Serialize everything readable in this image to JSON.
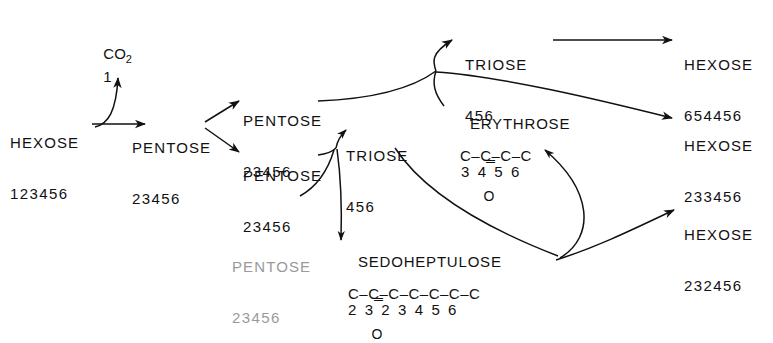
{
  "figure": {
    "background_color": "#ffffff",
    "ink_color": "#111111",
    "faded_ink_color": "#9a9a9a"
  },
  "nodes": {
    "hexose_start": {
      "name": "HEXOSE",
      "digits": "123456"
    },
    "co2": {
      "name": "CO",
      "subscript": "2",
      "digits": "1"
    },
    "pentose_main": {
      "name": "PENTOSE",
      "digits": "23456"
    },
    "pentose_upper": {
      "name": "PENTOSE",
      "digits": "23456"
    },
    "pentose_lower": {
      "name": "PENTOSE",
      "digits": "23456"
    },
    "pentose_faded": {
      "name": "PENTOSE",
      "digits": "23456"
    },
    "triose_top": {
      "name": "TRIOSE",
      "digits": "456"
    },
    "triose_mid": {
      "name": "TRIOSE",
      "digits": "456"
    },
    "erythrose": {
      "name": "ERYTHROSE",
      "backbone": "C–C–C–C",
      "carbonyl_bond": "‖",
      "carbonyl_atom": "O",
      "numbers": "3  4  5  6"
    },
    "sedoheptulose": {
      "name": "SEDOHEPTULOSE",
      "backbone": "C–C–C–C–C–C–C",
      "carbonyl_bond": "‖",
      "carbonyl_atom": "O",
      "numbers": "2  3  2  3  4  5  6"
    },
    "hexose_top": {
      "name": "HEXOSE",
      "digits": "654456"
    },
    "hexose_mid": {
      "name": "HEXOSE",
      "digits": "233456"
    },
    "hexose_bottom": {
      "name": "HEXOSE",
      "digits": "232456"
    }
  },
  "edges": [
    {
      "id": "hexose-to-pentose",
      "from": "hexose_start",
      "to": "pentose_main",
      "style": "straight-arrow"
    },
    {
      "id": "hexose-to-co2",
      "from": "hexose_start",
      "to": "co2",
      "style": "curved-arrow-up"
    },
    {
      "id": "pentose-to-pentose-upper",
      "from": "pentose_main",
      "to": "pentose_upper",
      "style": "straight-arrow"
    },
    {
      "id": "pentose-to-pentose-lower",
      "from": "pentose_main",
      "to": "pentose_lower",
      "style": "straight-arrow"
    },
    {
      "id": "pentose-upper-to-junction",
      "from": "pentose_upper",
      "to": "junction_top",
      "style": "curve"
    },
    {
      "id": "junction-to-triose-top",
      "from": "junction_top",
      "to": "triose_top",
      "style": "curved-arrow-up"
    },
    {
      "id": "junction-to-erythrose",
      "from": "junction_top",
      "to": "erythrose",
      "style": "curve-down"
    },
    {
      "id": "junction-to-hexose-mid",
      "from": "junction_top",
      "to": "hexose_mid",
      "style": "long-curved-arrow"
    },
    {
      "id": "triose-top-to-hexose-top",
      "from": "triose_top",
      "to": "hexose_top",
      "style": "straight-arrow"
    },
    {
      "id": "pentose-lower-to-triose-mid",
      "from": "pentose_lower",
      "to": "triose_mid",
      "style": "curved-arrow-up"
    },
    {
      "id": "pentose-lower-to-sedoheptulose",
      "from": "pentose_lower",
      "to": "sedoheptulose",
      "style": "curved-arrow-down"
    },
    {
      "id": "pentose-faded-to-sedoheptulose",
      "from": "pentose_faded",
      "to": "sedoheptulose",
      "style": "curved-arrow"
    },
    {
      "id": "triose-mid-to-loop",
      "from": "triose_mid",
      "to": "sedoheptulose_tail",
      "style": "long-curve-down"
    },
    {
      "id": "sedoheptulose-to-erythrose",
      "from": "sedoheptulose_tail",
      "to": "erythrose",
      "style": "loop-arrow-up"
    },
    {
      "id": "sedoheptulose-to-hexose-bottom",
      "from": "sedoheptulose_tail",
      "to": "hexose_bottom",
      "style": "curved-arrow"
    }
  ]
}
